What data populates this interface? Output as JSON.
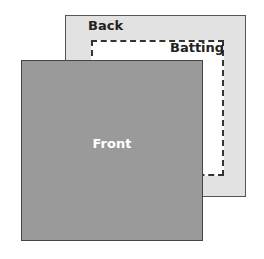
{
  "diagram": {
    "layers": [
      {
        "id": "back",
        "label": "Back",
        "color": "#e2e2e2"
      },
      {
        "id": "batting",
        "label": "Batting",
        "color": "#ffffff"
      },
      {
        "id": "front",
        "label": "Front",
        "color": "#9a9a9a"
      }
    ]
  }
}
